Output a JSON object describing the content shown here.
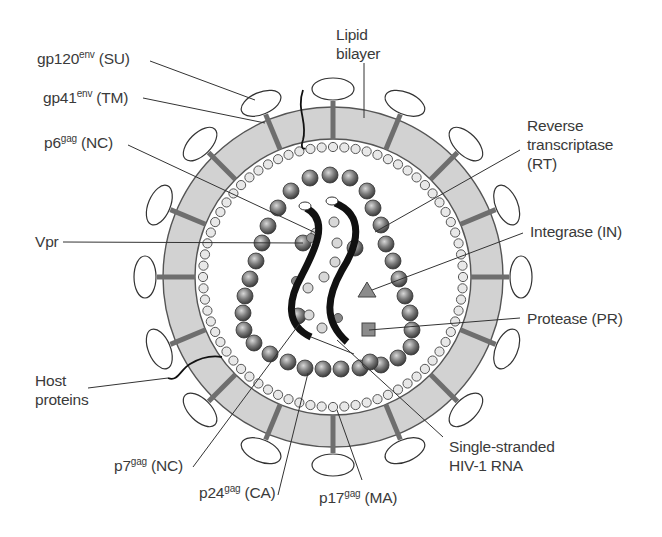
{
  "figure": {
    "colors": {
      "membrane_fill": "#d2d2d2",
      "membrane_stroke": "#555555",
      "spike_stem": "#6e6e6e",
      "matrix_ring": "#e4e4e4",
      "capsid_bead_dark": "#4a4a4a",
      "capsid_bead_light": "#c9c9c9",
      "rna": "#111111",
      "leader_line": "#333333",
      "enzyme_fill": "#8c8c8c"
    },
    "geometry": {
      "center": [
        333,
        277
      ],
      "outer_radius": 170,
      "inner_radius": 138,
      "matrix_ring_radius": 130,
      "spike_count": 16
    }
  },
  "labels": {
    "gp120": {
      "base": "gp120",
      "sup": "env",
      "suffix": " (SU)"
    },
    "gp41": {
      "base": "gp41",
      "sup": "env",
      "suffix": " (TM)"
    },
    "p6": {
      "base": "p6",
      "sup": "gag",
      "suffix": " (NC)"
    },
    "vpr": {
      "text": "Vpr"
    },
    "host_proteins": {
      "line1": "Host",
      "line2": "proteins"
    },
    "p7": {
      "base": "p7",
      "sup": "gag",
      "suffix": " (NC)"
    },
    "p24": {
      "base": "p24",
      "sup": "gag",
      "suffix": " (CA)"
    },
    "p17": {
      "base": "p17",
      "sup": "gag",
      "suffix": " (MA)"
    },
    "lipid_bilayer": {
      "line1": "Lipid",
      "line2": "bilayer"
    },
    "reverse_transcriptase": {
      "line1": "Reverse",
      "line2": "transcriptase",
      "line3": "(RT)"
    },
    "integrase": {
      "text": "Integrase (IN)"
    },
    "protease": {
      "text": "Protease (PR)"
    },
    "rna": {
      "line1": "Single-stranded",
      "line2": "HIV-1 RNA"
    }
  }
}
